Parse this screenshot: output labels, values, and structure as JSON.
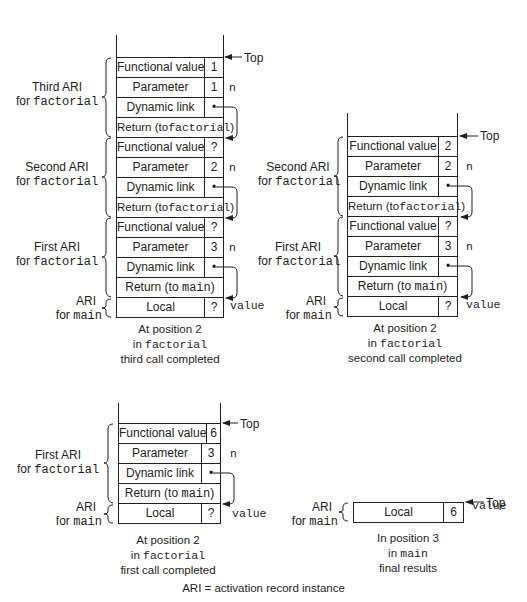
{
  "stacks": [
    {
      "id": "third-call-completed",
      "top_label": "Top",
      "rows": [
        {
          "label": "Functional value",
          "value": "1",
          "side": ""
        },
        {
          "label": "Parameter",
          "value": "1",
          "side": "n"
        },
        {
          "label": "Dynamic link",
          "value": "•",
          "side": ""
        },
        {
          "label_prefix": "Return (to",
          "label_code": "factorial",
          "label_suffix": ")",
          "value": null,
          "side": ""
        },
        {
          "label": "Functional value",
          "value": "?",
          "side": ""
        },
        {
          "label": "Parameter",
          "value": "2",
          "side": "n"
        },
        {
          "label": "Dynamic link",
          "value": "•",
          "side": ""
        },
        {
          "label_prefix": "Return (to",
          "label_code": "factorial",
          "label_suffix": ")",
          "value": null,
          "side": ""
        },
        {
          "label": "Functional value",
          "value": "?",
          "side": ""
        },
        {
          "label": "Parameter",
          "value": "3",
          "side": "n"
        },
        {
          "label": "Dynamic link",
          "value": "•",
          "side": ""
        },
        {
          "label_prefix": "Return (to ",
          "label_code": "main",
          "label_suffix": ")",
          "value": null,
          "side": ""
        },
        {
          "label": "Local",
          "value": "?",
          "side": "value"
        }
      ],
      "groups": [
        {
          "line1": "Third ARI",
          "line2_prefix": "for ",
          "line2_code": "factorial"
        },
        {
          "line1": "Second ARI",
          "line2_prefix": "for ",
          "line2_code": "factorial"
        },
        {
          "line1": "First ARI",
          "line2_prefix": "for ",
          "line2_code": "factorial"
        },
        {
          "line1": "ARI",
          "line2_prefix": "for ",
          "line2_code": "main"
        }
      ],
      "caption": {
        "line1": "At position 2",
        "line2_prefix": "in ",
        "line2_code": "factorial",
        "line3": "third call completed"
      }
    },
    {
      "id": "second-call-completed",
      "top_label": "Top",
      "rows": [
        {
          "label": "Functional value",
          "value": "2",
          "side": ""
        },
        {
          "label": "Parameter",
          "value": "2",
          "side": "n"
        },
        {
          "label": "Dynamic link",
          "value": "•",
          "side": ""
        },
        {
          "label_prefix": "Return (to",
          "label_code": "factorial",
          "label_suffix": ")",
          "value": null,
          "side": ""
        },
        {
          "label": "Functional value",
          "value": "?",
          "side": ""
        },
        {
          "label": "Parameter",
          "value": "3",
          "side": "n"
        },
        {
          "label": "Dynamic link",
          "value": "•",
          "side": ""
        },
        {
          "label_prefix": "Return (to ",
          "label_code": "main",
          "label_suffix": ")",
          "value": null,
          "side": ""
        },
        {
          "label": "Local",
          "value": "?",
          "side": "value"
        }
      ],
      "groups": [
        {
          "line1": "Second ARI",
          "line2_prefix": "for ",
          "line2_code": "factorial"
        },
        {
          "line1": "First ARI",
          "line2_prefix": "for ",
          "line2_code": "factorial"
        },
        {
          "line1": "ARI",
          "line2_prefix": "for ",
          "line2_code": "main"
        }
      ],
      "caption": {
        "line1": "At position 2",
        "line2_prefix": "in ",
        "line2_code": "factorial",
        "line3": "second call completed"
      }
    },
    {
      "id": "first-call-completed",
      "top_label": "Top",
      "rows": [
        {
          "label": "Functional value",
          "value": "6",
          "side": ""
        },
        {
          "label": "Parameter",
          "value": "3",
          "side": "n"
        },
        {
          "label": "Dynamic link",
          "value": "•",
          "side": ""
        },
        {
          "label_prefix": "Return (to ",
          "label_code": "main",
          "label_suffix": ")",
          "value": null,
          "side": ""
        },
        {
          "label": "Local",
          "value": "?",
          "side": "value"
        }
      ],
      "groups": [
        {
          "line1": "First ARI",
          "line2_prefix": "for ",
          "line2_code": "factorial"
        },
        {
          "line1": "ARI",
          "line2_prefix": "for ",
          "line2_code": "main"
        }
      ],
      "caption": {
        "line1": "At position 2",
        "line2_prefix": "in ",
        "line2_code": "factorial",
        "line3": "first call completed"
      }
    },
    {
      "id": "final-results",
      "top_label": "Top",
      "rows": [
        {
          "label": "Local",
          "value": "6",
          "side": "value"
        }
      ],
      "groups": [
        {
          "line1": "ARI",
          "line2_prefix": "for ",
          "line2_code": "main"
        }
      ],
      "caption": {
        "line1": "In position 3",
        "line2_prefix": "in ",
        "line2_code": "main",
        "line3": "final results"
      }
    }
  ],
  "legend": "ARI = activation record instance"
}
